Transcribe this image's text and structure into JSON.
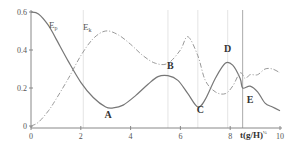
{
  "chart_data": {
    "type": "line",
    "title": "",
    "xlabel": "t(g/H)^½",
    "xlabel_main": "t(g/H)",
    "xlabel_sup": "½",
    "ylabel": "",
    "xlim": [
      0,
      10
    ],
    "ylim": [
      0,
      0.6
    ],
    "x_ticks": [
      0,
      2,
      4,
      6,
      8,
      10
    ],
    "y_ticks": [
      0,
      0.2,
      0.4,
      0.6
    ],
    "x_tick_labels": [
      "0",
      "2",
      "4",
      "6",
      "8",
      "10"
    ],
    "y_tick_labels": [
      "0",
      "0.2",
      "0.4",
      "0.6"
    ],
    "grid": "vertical reference lines only",
    "vertical_lines": [
      2.1,
      5.5,
      6.7,
      7.9,
      8.5
    ],
    "legend_position": "inline labels",
    "series": [
      {
        "name": "E_p",
        "label_main": "E",
        "label_sub": "p",
        "style": "solid",
        "x": [
          0,
          0.3,
          0.7,
          1.0,
          1.5,
          2.0,
          2.5,
          3.0,
          3.3,
          3.7,
          4.2,
          4.7,
          5.1,
          5.5,
          5.9,
          6.3,
          6.7,
          7.0,
          7.4,
          7.8,
          8.1,
          8.4,
          8.5,
          8.8,
          9.1,
          9.4,
          9.7,
          10.0
        ],
        "y": [
          0.6,
          0.59,
          0.53,
          0.46,
          0.34,
          0.23,
          0.15,
          0.1,
          0.095,
          0.11,
          0.16,
          0.22,
          0.26,
          0.265,
          0.24,
          0.17,
          0.1,
          0.14,
          0.25,
          0.33,
          0.32,
          0.25,
          0.2,
          0.21,
          0.18,
          0.12,
          0.1,
          0.08
        ]
      },
      {
        "name": "E_k",
        "label_main": "E",
        "label_sub": "k",
        "style": "dash-dot",
        "x": [
          0,
          0.3,
          0.7,
          1.0,
          1.5,
          2.0,
          2.5,
          3.0,
          3.5,
          4.0,
          4.5,
          5.0,
          5.5,
          6.0,
          6.3,
          6.7,
          7.0,
          7.4,
          7.8,
          8.1,
          8.4,
          8.6,
          8.8,
          9.1,
          9.4,
          9.7,
          10.0
        ],
        "y": [
          0.0,
          0.02,
          0.08,
          0.14,
          0.25,
          0.37,
          0.46,
          0.5,
          0.48,
          0.43,
          0.37,
          0.33,
          0.33,
          0.4,
          0.47,
          0.37,
          0.24,
          0.18,
          0.17,
          0.21,
          0.28,
          0.25,
          0.27,
          0.27,
          0.3,
          0.3,
          0.28
        ]
      }
    ],
    "annotations": [
      {
        "text": "A",
        "x": 3.1,
        "y": 0.04
      },
      {
        "text": "B",
        "x": 5.6,
        "y": 0.3
      },
      {
        "text": "C",
        "x": 6.8,
        "y": 0.07
      },
      {
        "text": "D",
        "x": 7.9,
        "y": 0.39
      },
      {
        "text": "E",
        "x": 8.8,
        "y": 0.12
      }
    ]
  }
}
